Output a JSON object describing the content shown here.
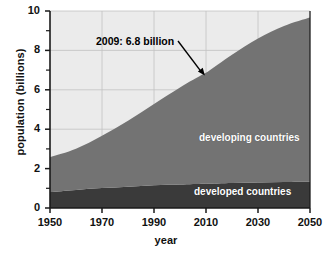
{
  "chart_data": {
    "type": "area",
    "title": "",
    "subtitle": "",
    "xlabel": "year",
    "ylabel": "population (billions)",
    "xlim": [
      1950,
      2050
    ],
    "ylim": [
      0,
      10
    ],
    "grid": true,
    "stacked": true,
    "legend_position": "inline-labels",
    "plot_background": "#ebebeb",
    "x": [
      1950,
      1960,
      1970,
      1980,
      1990,
      2000,
      2009,
      2010,
      2020,
      2030,
      2040,
      2050
    ],
    "series": [
      {
        "name": "developed countries",
        "color": "#3a3a3a",
        "label_color": "#ffffff",
        "values": [
          0.81,
          0.92,
          1.01,
          1.08,
          1.15,
          1.19,
          1.23,
          1.23,
          1.27,
          1.3,
          1.32,
          1.33
        ]
      },
      {
        "name": "developing countries",
        "color": "#737373",
        "label_color": "#ffffff",
        "values": [
          1.77,
          2.09,
          2.66,
          3.35,
          4.13,
          4.93,
          5.57,
          5.63,
          6.51,
          7.3,
          7.92,
          8.34
        ]
      }
    ],
    "totals": [
      2.58,
      3.01,
      3.67,
      4.43,
      5.28,
      6.12,
      6.8,
      6.86,
      7.78,
      8.6,
      9.24,
      9.67
    ],
    "yticks_major": [
      0,
      2,
      4,
      6,
      8,
      10
    ],
    "yticks_minor": [
      1,
      3,
      5,
      7,
      9
    ],
    "ytick_labels": [
      "0",
      "2",
      "4",
      "6",
      "8",
      "10"
    ],
    "xticks": [
      1950,
      1970,
      1990,
      2010,
      2030,
      2050
    ],
    "xtick_labels": [
      "1950",
      "1970",
      "1990",
      "2010",
      "2030",
      "2050"
    ],
    "annotations": [
      {
        "text": "2009: 6.8 billion",
        "x": 2009,
        "y": 6.8,
        "arrow": true
      }
    ]
  }
}
